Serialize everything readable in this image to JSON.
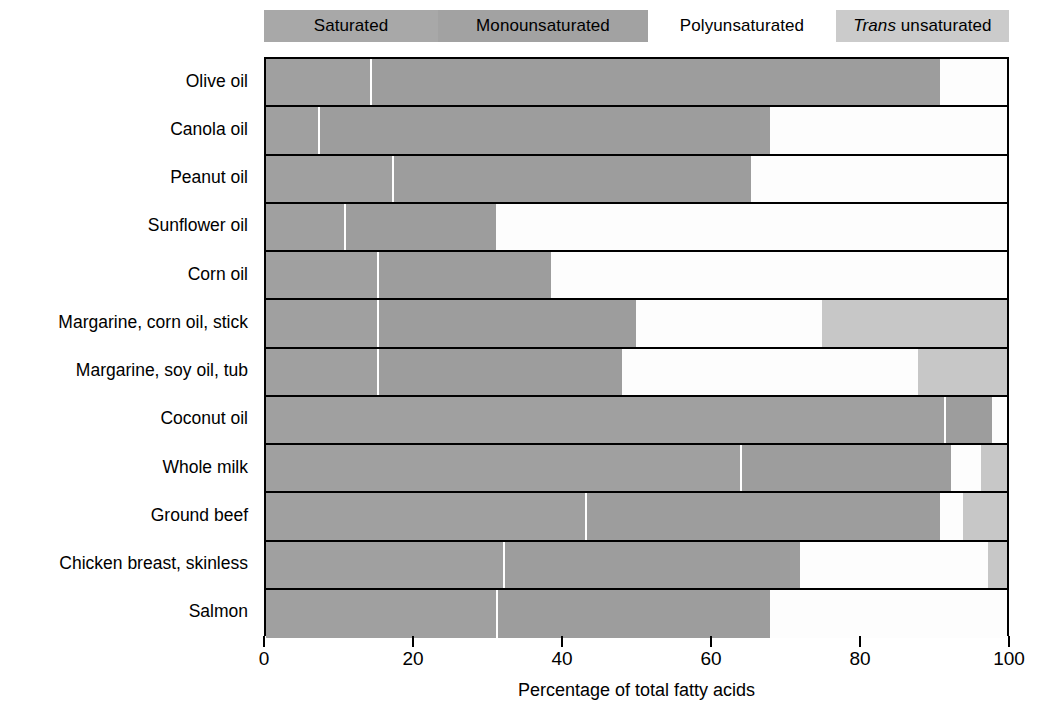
{
  "legend": {
    "items": [
      {
        "key": "saturated",
        "label": "Saturated",
        "label2": "",
        "color": "#a8a8a8",
        "italic_first": false
      },
      {
        "key": "monounsaturated",
        "label": "Monounsaturated",
        "label2": "",
        "color": "#a2a2a2",
        "italic_first": false
      },
      {
        "key": "polyunsaturated",
        "label": "Polyunsaturated",
        "label2": "",
        "color": "#ffffff",
        "italic_first": false
      },
      {
        "key": "trans",
        "label": "Trans",
        "label2": "unsaturated",
        "color": "#cbcbcb",
        "italic_first": true
      }
    ]
  },
  "axis": {
    "xlabel": "Percentage of total fatty acids",
    "ticks": [
      "0",
      "20",
      "40",
      "60",
      "80",
      "100"
    ],
    "tick_values": [
      0,
      20,
      40,
      60,
      80,
      100
    ],
    "xlim": [
      0,
      100
    ]
  },
  "chart_data": {
    "type": "bar",
    "orientation": "horizontal",
    "stacked": true,
    "title": "",
    "xlabel": "Percentage of total fatty acids",
    "ylabel": "",
    "xlim": [
      0,
      100
    ],
    "grid": false,
    "legend_position": "top",
    "series": [
      {
        "name": "Saturated",
        "color": "#a0a0a0",
        "values": [
          14.0,
          7.0,
          17.0,
          10.5,
          15.0,
          15.0,
          15.0,
          91.5,
          64.0,
          43.0,
          32.0,
          31.0
        ]
      },
      {
        "name": "Monounsaturated",
        "color": "#9d9d9d",
        "values": [
          77.0,
          61.0,
          48.5,
          20.5,
          23.5,
          35.0,
          33.0,
          6.5,
          28.5,
          48.0,
          40.0,
          37.0
        ]
      },
      {
        "name": "Polyunsaturated",
        "color": "#fdfdfd",
        "values": [
          9.0,
          32.0,
          34.5,
          69.0,
          61.5,
          25.0,
          40.0,
          2.0,
          4.0,
          3.0,
          25.5,
          32.0
        ]
      },
      {
        "name": "Trans unsaturated",
        "color": "#c7c7c7",
        "values": [
          0.0,
          0.0,
          0.0,
          0.0,
          0.0,
          25.0,
          12.0,
          0.0,
          3.5,
          6.0,
          2.5,
          0.0
        ]
      }
    ],
    "categories": [
      "Olive oil",
      "Canola oil",
      "Peanut oil",
      "Sunflower oil",
      "Corn oil",
      "Margarine, corn oil, stick",
      "Margarine, soy oil, tub",
      "Coconut oil",
      "Whole milk",
      "Ground beef",
      "Chicken breast, skinless",
      "Salmon"
    ]
  }
}
